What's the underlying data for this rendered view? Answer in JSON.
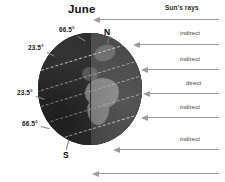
{
  "figure": {
    "title": "June",
    "sun_label": "Sun's rays",
    "type": "earth-seasons-illumination-diagram"
  },
  "globe": {
    "north_pole_label": "N",
    "south_pole_label": "S",
    "latitude_labels": [
      {
        "id": "arctic-circle",
        "text": "66.5°",
        "side": "top"
      },
      {
        "id": "tropic-of-cancer",
        "text": "23.5°",
        "side": "upper-left"
      },
      {
        "id": "tropic-of-capricorn",
        "text": "23.5°",
        "side": "lower-left"
      },
      {
        "id": "antarctic-circle",
        "text": "66.5°",
        "side": "bottom-left"
      }
    ],
    "colors": {
      "night_half": "#2b2b2b",
      "day_half": "#4c4c4c",
      "land": "#8d8d8d",
      "latitude_line": "#cfcfcf"
    }
  },
  "rays": [
    {
      "id": "ray-1",
      "label": "",
      "direction": "left"
    },
    {
      "id": "ray-2",
      "label": "indirect",
      "direction": "left"
    },
    {
      "id": "ray-3",
      "label": "indirect",
      "direction": "left"
    },
    {
      "id": "ray-4",
      "label": "direct",
      "direction": "left"
    },
    {
      "id": "ray-5",
      "label": "indirect",
      "direction": "left"
    },
    {
      "id": "ray-6",
      "label": "indirect",
      "direction": "left"
    },
    {
      "id": "ray-7",
      "label": "",
      "direction": "left"
    }
  ],
  "colors": {
    "background": "#ffffff",
    "arrow": "#9c9c9c",
    "text": "#2b2b2b"
  }
}
